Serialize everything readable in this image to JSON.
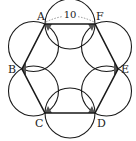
{
  "diagram": {
    "vertices": [
      {
        "name": "A",
        "x": 45,
        "y": 24
      },
      {
        "name": "F",
        "x": 95,
        "y": 24
      },
      {
        "name": "E",
        "x": 118,
        "y": 69
      },
      {
        "name": "D",
        "x": 95,
        "y": 113
      },
      {
        "name": "C",
        "x": 45,
        "y": 113
      },
      {
        "name": "B",
        "x": 22,
        "y": 69
      }
    ],
    "side_length_label": "10",
    "labels": {
      "A": "A",
      "B": "B",
      "C": "C",
      "D": "D",
      "E": "E",
      "F": "F"
    },
    "colors": {
      "stroke": "#1a1a1a",
      "shade": "#555555",
      "dotted": "#777777"
    }
  }
}
